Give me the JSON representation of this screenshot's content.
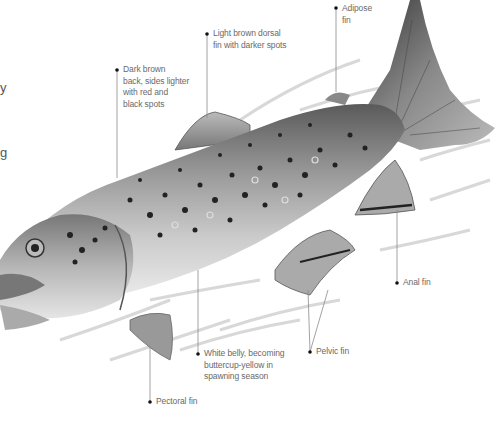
{
  "diagram": {
    "style": "grayscale pencil illustration",
    "colors": {
      "background": "#ffffff",
      "label_text": "#6a6a6a",
      "leader_line": "#8a8a8a",
      "dot": "#111111"
    },
    "edge_fragments": [
      {
        "text": "y",
        "x": 0,
        "y": 88
      },
      {
        "text": "g",
        "x": 0,
        "y": 153
      }
    ],
    "labels": [
      {
        "id": "back",
        "text": "Dark brown\nback, sides lighter\nwith red and\nblack spots",
        "x": 123,
        "y": 66
      },
      {
        "id": "dorsal-fin",
        "text": "Light brown dorsal\nfin with darker spots",
        "x": 214,
        "y": 30
      },
      {
        "id": "adipose-fin",
        "text": "Adipose\nfin",
        "x": 343,
        "y": 4
      },
      {
        "id": "anal-fin",
        "text": "Anal fin",
        "x": 403,
        "y": 279
      },
      {
        "id": "pelvic-fin",
        "text": "Pelvic fin",
        "x": 316,
        "y": 348
      },
      {
        "id": "belly",
        "text": "White belly, becoming\nbuttercup-yellow in\nspawning season",
        "x": 205,
        "y": 350
      },
      {
        "id": "pectoral-fin",
        "text": "Pectoral fin",
        "x": 156,
        "y": 398
      }
    ]
  }
}
